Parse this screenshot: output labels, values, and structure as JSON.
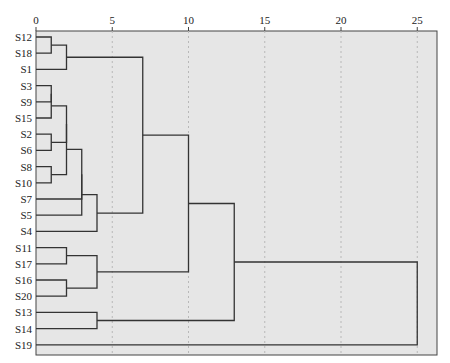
{
  "chart_data": {
    "type": "dendrogram",
    "title": "",
    "xlabel": "",
    "ylabel": "",
    "xlim": [
      0,
      25
    ],
    "x_ticks": [
      0,
      5,
      10,
      15,
      20,
      25
    ],
    "x_tick_labels": [
      "0",
      "5",
      "10",
      "15",
      "20",
      "25"
    ],
    "x_axis_position": "top",
    "grid": "vertical dashed at ticks",
    "leaves": [
      "S12",
      "S18",
      "S1",
      "S3",
      "S9",
      "S15",
      "S2",
      "S6",
      "S8",
      "S10",
      "S7",
      "S5",
      "S4",
      "S11",
      "S17",
      "S16",
      "S20",
      "S13",
      "S14",
      "S19"
    ],
    "merges": [
      {
        "id": "A",
        "children": [
          "S12",
          "S18"
        ],
        "height": 1.0
      },
      {
        "id": "B",
        "children": [
          "A",
          "S1"
        ],
        "height": 2.0
      },
      {
        "id": "C",
        "children": [
          "S3",
          "S9"
        ],
        "height": 1.0
      },
      {
        "id": "D",
        "children": [
          "S15",
          "C"
        ],
        "height": 1.0
      },
      {
        "id": "E",
        "children": [
          "S2",
          "S6"
        ],
        "height": 1.0
      },
      {
        "id": "F",
        "children": [
          "D",
          "E"
        ],
        "height": 2.0
      },
      {
        "id": "G",
        "children": [
          "S8",
          "S10"
        ],
        "height": 1.0
      },
      {
        "id": "H",
        "children": [
          "F",
          "G"
        ],
        "height": 2.0
      },
      {
        "id": "I",
        "children": [
          "H",
          "S7"
        ],
        "height": 3.0
      },
      {
        "id": "J",
        "children": [
          "I",
          "S5"
        ],
        "height": 3.0
      },
      {
        "id": "K",
        "children": [
          "J",
          "S4"
        ],
        "height": 4.0
      },
      {
        "id": "L",
        "children": [
          "B",
          "K"
        ],
        "height": 7.0
      },
      {
        "id": "M",
        "children": [
          "S11",
          "S17"
        ],
        "height": 2.0
      },
      {
        "id": "N",
        "children": [
          "S16",
          "S20"
        ],
        "height": 2.0
      },
      {
        "id": "O",
        "children": [
          "M",
          "N"
        ],
        "height": 4.0
      },
      {
        "id": "P",
        "children": [
          "L",
          "O"
        ],
        "height": 10.0
      },
      {
        "id": "Q",
        "children": [
          "S13",
          "S14"
        ],
        "height": 4.0
      },
      {
        "id": "R",
        "children": [
          "P",
          "Q"
        ],
        "height": 13.0
      },
      {
        "id": "S",
        "children": [
          "R",
          "S19"
        ],
        "height": 25.0
      }
    ]
  },
  "colors": {
    "plot_background": "#e6e6e6",
    "lines": "#333333",
    "grid": "#b8b8b8",
    "text": "#222222"
  }
}
